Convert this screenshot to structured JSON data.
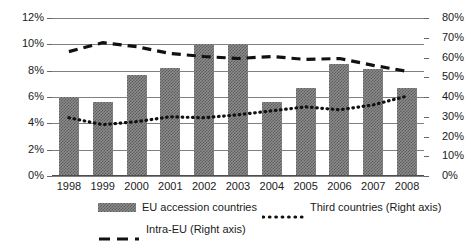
{
  "chart_data": {
    "type": "bar",
    "title": "",
    "subtitle": "",
    "xlabel": "",
    "ylabel": "",
    "categories": [
      "1998",
      "1999",
      "2000",
      "2001",
      "2002",
      "2003",
      "2004",
      "2005",
      "2006",
      "2007",
      "2008"
    ],
    "axes": {
      "left": {
        "label": "",
        "ylim": [
          0,
          12
        ],
        "tick_step": 2,
        "ticks": [
          "0%",
          "2%",
          "4%",
          "6%",
          "8%",
          "10%",
          "12%"
        ],
        "tick_values": [
          0,
          2,
          4,
          6,
          8,
          10,
          12
        ],
        "unit": "%"
      },
      "right": {
        "label": "",
        "ylim": [
          0,
          80
        ],
        "tick_step": 10,
        "ticks": [
          "0%",
          "10%",
          "20%",
          "30%",
          "40%",
          "50%",
          "60%",
          "70%",
          "80%"
        ],
        "tick_values": [
          0,
          10,
          20,
          30,
          40,
          50,
          60,
          70,
          80
        ],
        "unit": "%"
      }
    },
    "grid": true,
    "legend_position": "bottom",
    "series": [
      {
        "name": "EU accession countries",
        "type": "bar",
        "axis": "left",
        "pattern": "hatched",
        "color": "#8c8c8c",
        "values": [
          6.0,
          5.6,
          7.7,
          8.2,
          10.0,
          10.0,
          5.6,
          6.7,
          8.5,
          8.1,
          6.7
        ]
      },
      {
        "name": "Third countries (Right axis)",
        "type": "line",
        "axis": "right",
        "style": "dotted",
        "color": "#111111",
        "values": [
          29.5,
          26.0,
          27.5,
          30.0,
          29.5,
          31.0,
          33.0,
          35.0,
          33.5,
          36.0,
          40.5
        ]
      },
      {
        "name": "Intra-EU (Right axis)",
        "type": "line",
        "axis": "right",
        "style": "dashed",
        "color": "#111111",
        "values": [
          63.0,
          67.5,
          65.5,
          62.0,
          60.5,
          59.5,
          60.5,
          59.0,
          59.5,
          56.0,
          53.0
        ]
      }
    ]
  },
  "legend": {
    "items": [
      {
        "label": "EU accession countries",
        "marker": "bar-swatch"
      },
      {
        "label": "Third countries (Right axis)",
        "marker": "dotted-line-swatch"
      },
      {
        "label": "Intra-EU (Right axis)",
        "marker": "dashed-line-swatch"
      }
    ]
  }
}
